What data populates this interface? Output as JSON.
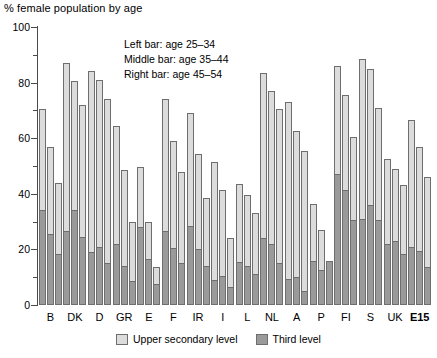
{
  "chart_data": {
    "type": "bar",
    "title": "% female population by age",
    "xlabel": "",
    "ylabel": "",
    "ylim": [
      0,
      100
    ],
    "ytick_step": 20,
    "yminor_step": 10,
    "grid": false,
    "stacked": true,
    "legend_position": "bottom",
    "yticks": [
      0,
      20,
      40,
      60,
      80,
      100
    ],
    "ytick_labels": [
      "0",
      "20",
      "40",
      "60",
      "80",
      "100"
    ],
    "categories": [
      "B",
      "DK",
      "D",
      "GR",
      "E",
      "F",
      "IR",
      "I",
      "L",
      "NL",
      "A",
      "P",
      "FI",
      "S",
      "UK",
      "E15"
    ],
    "bold_categories": [
      "E15"
    ],
    "annotations": [
      "Left bar: age 25–34",
      "Middle bar: age 35–44",
      "Right bar: age 45–54"
    ],
    "legend": [
      {
        "label": "Upper secondary level",
        "color": "#dcdcdc"
      },
      {
        "label": "Third level",
        "color": "#9a9a9a"
      }
    ],
    "age_groups": [
      "age 25–34",
      "age 35–44",
      "age 45–54"
    ],
    "series": [
      {
        "name": "Upper secondary level",
        "color": "#dcdcdc",
        "note": "total bar height (upper secondary + third level)",
        "values_by_age": {
          "age 25–34": [
            70.5,
            87,
            84,
            64.5,
            49.5,
            74,
            69,
            51.5,
            43.5,
            83.5,
            73,
            36.5,
            86,
            88.5,
            52.5,
            66.5
          ],
          "age 35–44": [
            57,
            80.5,
            81,
            48.5,
            30,
            59,
            54.5,
            41.5,
            39.5,
            77,
            62.5,
            27,
            75.5,
            85,
            49,
            57
          ],
          "age 45–54": [
            44,
            72,
            74,
            30,
            13.5,
            48,
            38.5,
            24,
            33,
            70.5,
            55.5,
            16,
            60.5,
            71,
            43,
            46
          ]
        }
      },
      {
        "name": "Third level",
        "color": "#9a9a9a",
        "note": "lower dark segment of each stacked bar",
        "values_by_age": {
          "age 25–34": [
            34,
            26.5,
            19,
            22,
            28,
            26.5,
            28.5,
            9,
            15.5,
            24,
            9.5,
            16,
            47,
            31,
            22,
            21
          ],
          "age 35–44": [
            25.5,
            34,
            21,
            14,
            16.5,
            20.5,
            20,
            10.5,
            14,
            22,
            10,
            12.5,
            41.5,
            36,
            23,
            19.5
          ],
          "age 45–54": [
            18.5,
            24.5,
            15,
            8.5,
            7.5,
            15,
            14,
            6.5,
            11,
            15,
            5,
            16,
            30.5,
            30.5,
            18.5,
            13.5
          ]
        }
      }
    ]
  }
}
